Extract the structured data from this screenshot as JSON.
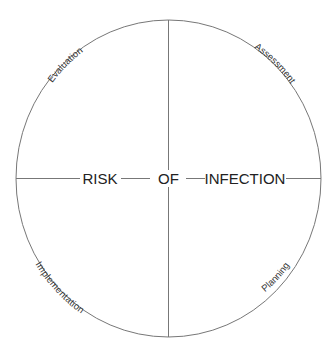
{
  "diagram": {
    "center_text": [
      "RISK",
      "OF",
      "INFECTION"
    ],
    "quadrants": {
      "top_left": "Evaluation",
      "top_right": "Assessment",
      "bottom_right": "Planning",
      "bottom_left": "Implementation"
    },
    "line_color": "#777777",
    "text_color": "#222222"
  }
}
